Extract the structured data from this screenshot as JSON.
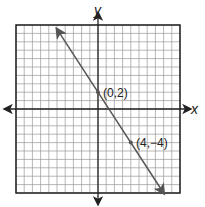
{
  "chart_data": {
    "type": "line",
    "title": "",
    "xlabel": "x",
    "ylabel": "y",
    "xlim": [
      -10,
      10
    ],
    "ylim": [
      -10,
      10
    ],
    "grid": true,
    "grid_step": 1,
    "series": [
      {
        "name": "line",
        "equation": "y = -1.5x + 2",
        "x": [
          -5,
          0,
          4,
          8
        ],
        "values": [
          9.5,
          2,
          -4,
          -10
        ]
      }
    ],
    "annotations": [
      {
        "label": "(0,2)",
        "x": 0,
        "y": 2
      },
      {
        "label": "(4,−4)",
        "x": 4,
        "y": -4
      }
    ]
  },
  "labels": {
    "x_axis": "x",
    "y_axis": "y",
    "point1": "(0,2)",
    "point2": "(4,−4)"
  },
  "colors": {
    "grid": "#9a9a9a",
    "axis": "#222222",
    "line": "#555555"
  }
}
